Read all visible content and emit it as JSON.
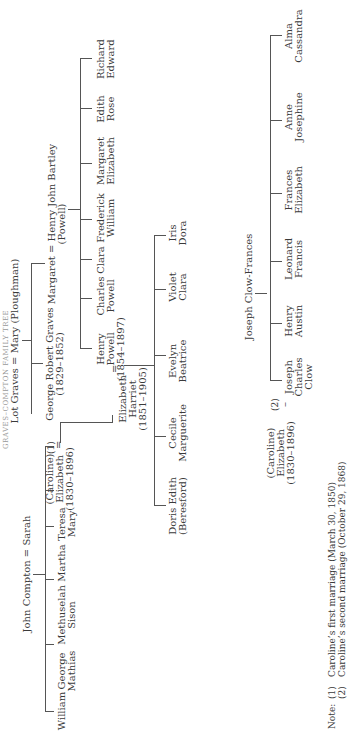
{
  "title": "GRAVES–COMPTON FAMILY TREE",
  "families": {
    "compton": {
      "parents": "John Compton = Sarah",
      "children": [
        {
          "name": "William"
        },
        {
          "name": "George\nMathias"
        },
        {
          "name": "Methuselah\nSison"
        },
        {
          "name": "Martha"
        },
        {
          "name": "Teresa\nMary"
        },
        {
          "name": "(Caroline)\nElizabeth\n(1830–1896)"
        }
      ]
    },
    "graves": {
      "parents": "Lot Graves = Mary (Ploughman)",
      "children": [
        {
          "name": "George Robert Graves\n(1829–1852)"
        },
        {
          "name": "Margaret = Henry John Bartley\n(Powell)"
        }
      ],
      "marriage_1_marker": "(1)",
      "equals": "="
    },
    "bartley": {
      "children": [
        {
          "name": "Henry\nPowell\n(1854–1897)"
        },
        {
          "name": "Charles\nPowell"
        },
        {
          "name": "Clara"
        },
        {
          "name": "Frederick\nWilliam"
        },
        {
          "name": "Margaret\nElizabeth"
        },
        {
          "name": "Edith\nRose"
        },
        {
          "name": "Richard\nEdward"
        }
      ]
    },
    "powell": {
      "wife": "Elizabeth\nHarriet\n(1851–1905)",
      "equals": "=",
      "children": [
        {
          "name": "Doris Edith\n(Beresford)"
        },
        {
          "name": "Cecile\nMarguerite"
        },
        {
          "name": "Evelyn\nBeatrice"
        },
        {
          "name": "Violet\nClara"
        },
        {
          "name": "Iris\nDora"
        }
      ]
    },
    "clow": {
      "caroline": "(Caroline)\nElizabeth\n(1830–1896)",
      "marriage_2_marker": "(2)",
      "equals": "–",
      "husband": "Joseph Clow-Frances",
      "children": [
        {
          "name": "Joseph\nCharles\nClow"
        },
        {
          "name": "Henry\nAustin"
        },
        {
          "name": "Leonard\nFrancis"
        },
        {
          "name": "Frances\nElizabeth"
        },
        {
          "name": "Anne\nJosephine"
        },
        {
          "name": "Alma\nCassandra"
        }
      ]
    }
  },
  "notes": {
    "label": "Note:",
    "items": [
      {
        "marker": "(1)",
        "text": "Caroline’s first marriage (March 30, 1850)"
      },
      {
        "marker": "(2)",
        "text": "Caroline’s second  marriage (October 29, 1868)"
      }
    ]
  }
}
